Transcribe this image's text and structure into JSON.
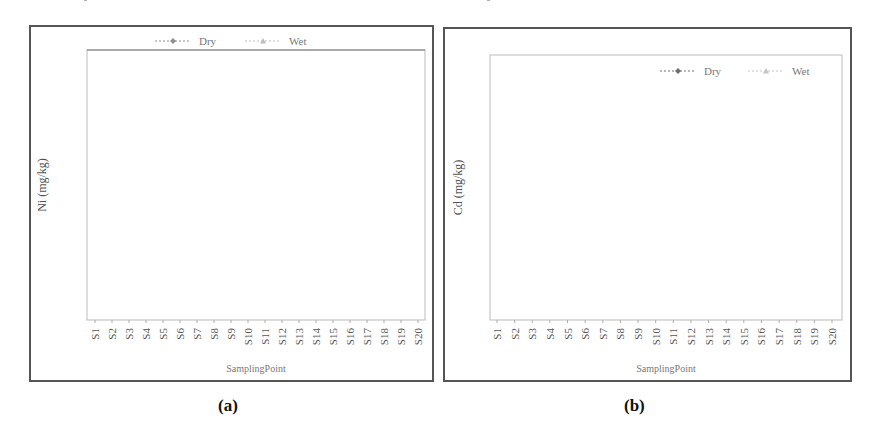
{
  "panels": [
    {
      "id": "a",
      "caption": "(a)"
    },
    {
      "id": "b",
      "caption": "(b)"
    }
  ],
  "chart_data": [
    {
      "type": "line",
      "panel": "(a)",
      "title": "",
      "xlabel": "SamplingPoint",
      "ylabel": "Ni (mg/kg)",
      "categories": [
        "S1",
        "S2",
        "S3",
        "S4",
        "S5",
        "S6",
        "S7",
        "S8",
        "S9",
        "S10",
        "S11",
        "S12",
        "S13",
        "S14",
        "S15",
        "S16",
        "S17",
        "S18",
        "S19",
        "S20"
      ],
      "yticks": [
        5,
        25,
        45,
        65
      ],
      "ylim": [
        5,
        70
      ],
      "grid": false,
      "legend_position": "top",
      "series": [
        {
          "name": "Dry",
          "marker": "diamond",
          "color": "#8f8f8f",
          "values": [
            30,
            40,
            46,
            69,
            43,
            48,
            50,
            52,
            31,
            49,
            68,
            61,
            37,
            44,
            45,
            59,
            38,
            38,
            53,
            63
          ]
        },
        {
          "name": "Wet",
          "marker": "triangle",
          "color": "#bdbdbd",
          "values": [
            31,
            18,
            32,
            31.5,
            31.5,
            36,
            41,
            34,
            37,
            47,
            48.5,
            41,
            38.5,
            44,
            20,
            25.5,
            52,
            11.5,
            42,
            42
          ]
        }
      ]
    },
    {
      "type": "line",
      "panel": "(b)",
      "title": "",
      "xlabel": "SamplingPoint",
      "ylabel": "Cd (mg/kg)",
      "categories": [
        "S1",
        "S2",
        "S3",
        "S4",
        "S5",
        "S6",
        "S7",
        "S8",
        "S9",
        "S10",
        "S11",
        "S12",
        "S13",
        "S14",
        "S15",
        "S16",
        "S17",
        "S18",
        "S19",
        "S20"
      ],
      "yticks": [
        0,
        2,
        4,
        6,
        8,
        10
      ],
      "ylim": [
        0,
        10
      ],
      "grid": false,
      "legend_position": "top-right inside",
      "series": [
        {
          "name": "Dry",
          "marker": "diamond",
          "color": "#6e6e6e",
          "values": [
            0,
            0,
            0.05,
            0,
            0,
            0,
            0,
            0.1,
            0,
            0,
            0,
            0,
            0,
            0,
            0,
            0,
            0,
            0,
            0,
            0
          ]
        },
        {
          "name": "Wet",
          "marker": "triangle",
          "color": "#c4c4c4",
          "values": [
            0.3,
            0.35,
            1.2,
            0.85,
            0.65,
            8.8,
            0.4,
            0.25,
            0.7,
            4.2,
            0.3,
            0.25,
            0.22,
            0.2,
            0.5,
            0.35,
            0.25,
            0.25,
            0.2,
            0.2
          ]
        }
      ]
    }
  ]
}
